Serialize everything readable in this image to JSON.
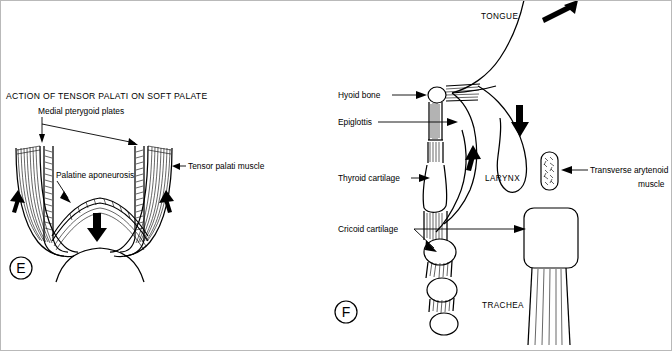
{
  "figure": {
    "kind": "anatomical-line-diagram",
    "background_color": "#ffffff",
    "ink_color": "#000000",
    "frame_color": "#b9b9b9",
    "width": 672,
    "height": 351
  },
  "panel_e": {
    "letter": "E",
    "title": "ACTION OF TENSOR PALATI ON SOFT PALATE",
    "labels": {
      "medial_pterygoid_plates": "Medial pterygoid plates",
      "palatine_aponeurosis": "Palatine aponeurosis",
      "tensor_palati_muscle": "Tensor palati  muscle"
    },
    "arrows": [
      {
        "name": "left-upward-pull",
        "direction": "up"
      },
      {
        "name": "right-upward-pull",
        "direction": "up"
      },
      {
        "name": "soft-palate-downward",
        "direction": "down"
      }
    ]
  },
  "panel_f": {
    "letter": "F",
    "labels": {
      "tongue": "TONGUE",
      "hyoid_bone": "Hyoid bone",
      "epiglottis": "Epiglottis",
      "thyroid_cartilage": "Thyroid cartilage",
      "cricoid_cartilage": "Cricoid cartilage",
      "larynx": "LARYNX",
      "transverse_arytenoid_muscle_line1": "Transverse arytenoid",
      "transverse_arytenoid_muscle_line2": "muscle",
      "trachea": "TRACHEA"
    },
    "arrows": [
      {
        "name": "tongue-upward-forward",
        "direction": "up-right"
      },
      {
        "name": "pharynx-downward",
        "direction": "down"
      },
      {
        "name": "larynx-upward",
        "direction": "up"
      }
    ]
  }
}
